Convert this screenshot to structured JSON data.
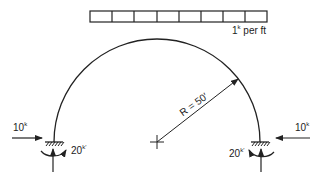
{
  "diagram": {
    "type": "structural-arch",
    "distributed_load": {
      "value": "1",
      "unit_superscript": "k",
      "suffix": " per ft",
      "cells": 8
    },
    "radius_label": "R = 50′",
    "left_support": {
      "horizontal_force": {
        "value": "10",
        "unit": "k",
        "direction": "right"
      },
      "moment": {
        "value": "20",
        "unit": "k′",
        "direction": "clockwise"
      },
      "vertical_reaction": "up"
    },
    "right_support": {
      "horizontal_force": {
        "value": "10",
        "unit": "k",
        "direction": "left"
      },
      "moment": {
        "value": "20",
        "unit": "k′",
        "direction": "counterclockwise"
      },
      "vertical_reaction": "up"
    },
    "colors": {
      "line": "#222222",
      "background": "#ffffff"
    }
  }
}
